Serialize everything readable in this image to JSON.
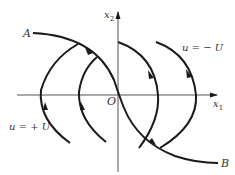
{
  "diagram": {
    "type": "phase-plane trajectories",
    "axes": {
      "x_label": "x",
      "x_subscript": "1",
      "y_label": "x",
      "y_subscript": "2",
      "origin_label": "O"
    },
    "points": {
      "start_label": "A",
      "end_label": "B"
    },
    "regions": {
      "left_label": "u = + U",
      "right_label": "u = − U"
    },
    "colors": {
      "stroke": "#1a1a1a",
      "axis": "#555555",
      "text": "#333333",
      "background": "#ffffff"
    }
  }
}
